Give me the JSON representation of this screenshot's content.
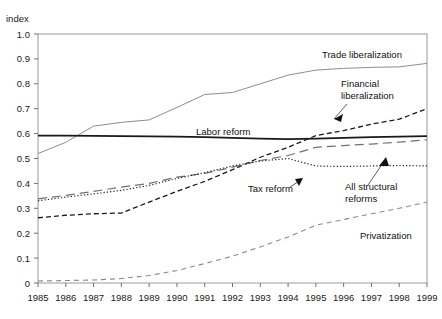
{
  "chart_data": {
    "type": "line",
    "title": "",
    "xlabel": "",
    "ylabel": "index",
    "ylim": [
      0,
      1.0
    ],
    "xlim": [
      1985,
      1999
    ],
    "grid": false,
    "legend_position": "inline-annotations",
    "categories": [
      1985,
      1986,
      1987,
      1988,
      1989,
      1990,
      1991,
      1992,
      1993,
      1994,
      1995,
      1996,
      1997,
      1998,
      1999
    ],
    "ytick_labels": [
      "0",
      "0.1",
      "0.2",
      "0.3",
      "0.4",
      "0.5",
      "0.6",
      "0.7",
      "0.8",
      "0.9",
      "1.0"
    ],
    "ytick_values": [
      0,
      0.1,
      0.2,
      0.3,
      0.4,
      0.5,
      0.6,
      0.7,
      0.8,
      0.9,
      1.0
    ],
    "xtick_labels": [
      "1985",
      "1986",
      "1987",
      "1988",
      "1989",
      "1990",
      "1991",
      "1992",
      "1993",
      "1994",
      "1995",
      "1996",
      "1997",
      "1998",
      "1999"
    ],
    "series": [
      {
        "name": "Trade liberalization",
        "style": "solid-thin-gray",
        "color": "#808080",
        "values": [
          0.52,
          0.565,
          0.63,
          0.645,
          0.655,
          0.705,
          0.757,
          0.765,
          0.8,
          0.835,
          0.855,
          0.862,
          0.866,
          0.868,
          0.882
        ]
      },
      {
        "name": "Labor reform",
        "style": "solid-bold-black",
        "color": "#1a1a1a",
        "values": [
          0.592,
          0.592,
          0.591,
          0.59,
          0.589,
          0.588,
          0.586,
          0.583,
          0.58,
          0.578,
          0.58,
          0.583,
          0.586,
          0.588,
          0.59
        ]
      },
      {
        "name": "Financial liberalization",
        "style": "dashed-black",
        "color": "#1a1a1a",
        "values": [
          0.262,
          0.272,
          0.278,
          0.281,
          0.325,
          0.368,
          0.408,
          0.455,
          0.505,
          0.545,
          0.592,
          0.612,
          0.638,
          0.658,
          0.7
        ]
      },
      {
        "name": "All structural reforms",
        "style": "long-dash-gray",
        "color": "#707070",
        "values": [
          0.338,
          0.352,
          0.368,
          0.385,
          0.4,
          0.425,
          0.44,
          0.465,
          0.492,
          0.512,
          0.545,
          0.552,
          0.558,
          0.566,
          0.575
        ]
      },
      {
        "name": "Tax reform",
        "style": "dotted-black",
        "color": "#2a2a2a",
        "values": [
          0.33,
          0.345,
          0.358,
          0.372,
          0.392,
          0.42,
          0.443,
          0.47,
          0.49,
          0.5,
          0.47,
          0.468,
          0.47,
          0.472,
          0.47
        ]
      },
      {
        "name": "Privatization",
        "style": "dashed-gray",
        "color": "#8a8a8a",
        "values": [
          0.008,
          0.01,
          0.012,
          0.018,
          0.03,
          0.05,
          0.078,
          0.108,
          0.145,
          0.185,
          0.232,
          0.255,
          0.278,
          0.3,
          0.325
        ]
      }
    ],
    "annotations": [
      {
        "label": "Trade liberalization",
        "x": 322,
        "y": 58,
        "arrow": false
      },
      {
        "label": "Financial",
        "x": 341,
        "y": 87,
        "arrow": false
      },
      {
        "label": "liberalization",
        "x": 341,
        "y": 99,
        "arrow": true
      },
      {
        "label": "Labor reform",
        "x": 196,
        "y": 135,
        "arrow": false
      },
      {
        "label": "Tax reform",
        "x": 248,
        "y": 192,
        "arrow": true
      },
      {
        "label": "All structural",
        "x": 345,
        "y": 190,
        "arrow": true
      },
      {
        "label": "reforms",
        "x": 345,
        "y": 202,
        "arrow": false
      },
      {
        "label": "Privatization",
        "x": 360,
        "y": 239,
        "arrow": false
      }
    ]
  }
}
